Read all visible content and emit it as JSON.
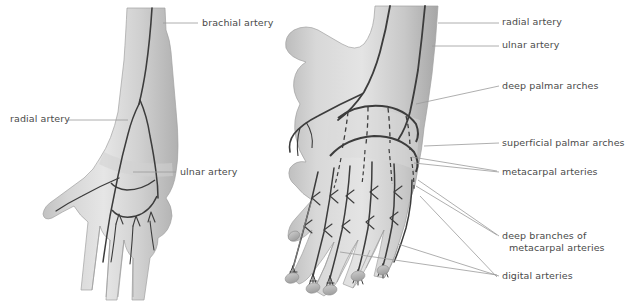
{
  "figure": {
    "background_color": "#ffffff",
    "text_color": "#4a4a4a",
    "leader_line_color": "#9a9a9a",
    "artery_line_color": "#3c3c3c",
    "skin_light": "#e2e2e2",
    "skin_mid": "#c6c6c6",
    "skin_dark": "#a8a8a8",
    "width": 626,
    "height": 304
  },
  "panels": [
    {
      "id": "left-panel",
      "name": "anterior-forearm-and-hand",
      "labels": [
        {
          "id": "brachial-artery",
          "text": "brachial artery",
          "x": 202,
          "y": 18,
          "align": "left",
          "leader": {
            "x1": 163,
            "y1": 23,
            "x2": 198,
            "y2": 23
          }
        },
        {
          "id": "radial-artery-left",
          "text": "radial artery",
          "x": 10,
          "y": 114,
          "align": "left",
          "leader": {
            "x1": 68,
            "y1": 120,
            "x2": 128,
            "y2": 120
          }
        },
        {
          "id": "ulnar-artery-left",
          "text": "ulnar artery",
          "x": 180,
          "y": 167,
          "align": "left",
          "leader": {
            "x1": 133,
            "y1": 172,
            "x2": 176,
            "y2": 172
          }
        }
      ]
    },
    {
      "id": "right-panel",
      "name": "dorsal-hand-arterial-arches",
      "labels": [
        {
          "id": "radial-artery-right",
          "text": "radial artery",
          "x": 502,
          "y": 17,
          "align": "left",
          "leader": {
            "x1": 438,
            "y1": 23,
            "x2": 499,
            "y2": 23
          }
        },
        {
          "id": "ulnar-artery-right",
          "text": "ulnar artery",
          "x": 502,
          "y": 40,
          "align": "left",
          "leader": {
            "x1": 432,
            "y1": 46,
            "x2": 499,
            "y2": 46
          }
        },
        {
          "id": "deep-palmar-arches",
          "text": "deep palmar arches",
          "x": 502,
          "y": 81,
          "align": "left",
          "leader": {
            "x1": 416,
            "y1": 104,
            "x2": 499,
            "y2": 86
          }
        },
        {
          "id": "superficial-palmar-arches",
          "text": "superficial palmar arches",
          "x": 502,
          "y": 138,
          "align": "left",
          "leader": {
            "x1": 424,
            "y1": 146,
            "x2": 499,
            "y2": 143
          }
        },
        {
          "id": "metacarpal-arteries",
          "text": "metacarpal arteries",
          "x": 502,
          "y": 167,
          "align": "left",
          "leader": {
            "x1": 414,
            "y1": 163,
            "x2": 499,
            "y2": 172
          }
        },
        {
          "id": "deep-branches-of-metacarpal-arteries",
          "text": "deep branches of",
          "text_line2": "metacarpal arteries",
          "x": 502,
          "y": 231,
          "align": "left",
          "leader": {
            "x1": 418,
            "y1": 180,
            "x2": 499,
            "y2": 236
          }
        },
        {
          "id": "digital-arteries",
          "text": "digital arteries",
          "x": 502,
          "y": 271,
          "align": "left",
          "leader": {
            "x1": 398,
            "y1": 244,
            "x2": 499,
            "y2": 276
          }
        }
      ],
      "extra_leaders": [
        {
          "id": "metacarpal-leader-2",
          "x1": 412,
          "y1": 157,
          "x2": 497,
          "y2": 171
        },
        {
          "id": "deep-branch-leader-2",
          "x1": 416,
          "y1": 186,
          "x2": 497,
          "y2": 235
        },
        {
          "id": "digital-leader-2",
          "x1": 340,
          "y1": 252,
          "x2": 497,
          "y2": 275
        },
        {
          "id": "digital-leader-3",
          "x1": 420,
          "y1": 196,
          "x2": 497,
          "y2": 277
        }
      ]
    }
  ]
}
